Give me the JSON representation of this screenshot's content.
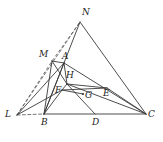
{
  "figure": {
    "kind": "geometry-diagram",
    "width": 163,
    "height": 142,
    "background": "#ffffff",
    "stroke_color": "#3a3a3a",
    "dash_color": "#555555",
    "label_color": "#1b1b1b"
  },
  "points": [
    {
      "id": "N",
      "label": "N",
      "x": 80,
      "y": 22,
      "label_x": 82,
      "label_y": 8,
      "marked": false
    },
    {
      "id": "M",
      "label": "M",
      "x": 52,
      "y": 61,
      "label_x": 39,
      "label_y": 50,
      "marked": false
    },
    {
      "id": "A",
      "label": "A",
      "x": 64,
      "y": 63,
      "label_x": 62,
      "label_y": 52,
      "marked": false
    },
    {
      "id": "H",
      "label": "H",
      "x": 67,
      "y": 84,
      "label_x": 66,
      "label_y": 71,
      "marked": false
    },
    {
      "id": "F",
      "label": "F",
      "x": 62,
      "y": 90,
      "label_x": 55,
      "label_y": 86,
      "marked": false
    },
    {
      "id": "G",
      "label": "G",
      "x": 83,
      "y": 94,
      "label_x": 85,
      "label_y": 91,
      "marked": true
    },
    {
      "id": "E",
      "label": "E",
      "x": 107,
      "y": 88,
      "label_x": 103,
      "label_y": 89,
      "marked": false
    },
    {
      "id": "L",
      "label": "L",
      "x": 17,
      "y": 115,
      "label_x": 5,
      "label_y": 110,
      "marked": false
    },
    {
      "id": "B",
      "label": "B",
      "x": 44,
      "y": 114,
      "label_x": 41,
      "label_y": 118,
      "marked": false
    },
    {
      "id": "D",
      "label": "D",
      "x": 95,
      "y": 114,
      "label_x": 92,
      "label_y": 118,
      "marked": false
    },
    {
      "id": "C",
      "label": "C",
      "x": 146,
      "y": 114,
      "label_x": 148,
      "label_y": 110,
      "marked": false
    }
  ],
  "solid_segments": [
    {
      "name": "segment-B-C",
      "from": "B",
      "to": "C"
    },
    {
      "name": "segment-N-C",
      "from": "N",
      "to": "C"
    },
    {
      "name": "segment-N-B",
      "from": "N",
      "to": "B"
    },
    {
      "name": "segment-M-B",
      "from": "M",
      "to": "B"
    },
    {
      "name": "segment-M-A",
      "from": "M",
      "to": "A"
    },
    {
      "name": "segment-M-H",
      "from": "M",
      "to": "H"
    },
    {
      "name": "segment-A-B",
      "from": "A",
      "to": "B"
    },
    {
      "name": "segment-A-H",
      "from": "A",
      "to": "H"
    },
    {
      "name": "segment-A-C",
      "from": "A",
      "to": "C"
    },
    {
      "name": "segment-L-A",
      "from": "L",
      "to": "A"
    },
    {
      "name": "segment-L-F",
      "from": "L",
      "to": "F"
    },
    {
      "name": "segment-H-F",
      "from": "H",
      "to": "F"
    },
    {
      "name": "segment-H-E",
      "from": "H",
      "to": "E"
    },
    {
      "name": "segment-H-C",
      "from": "H",
      "to": "C"
    },
    {
      "name": "segment-H-D",
      "from": "H",
      "to": "D"
    },
    {
      "name": "segment-F-G",
      "from": "F",
      "to": "G"
    },
    {
      "name": "segment-F-E",
      "from": "F",
      "to": "E"
    },
    {
      "name": "segment-E-C",
      "from": "E",
      "to": "C"
    },
    {
      "name": "segment-B-F",
      "from": "B",
      "to": "F"
    }
  ],
  "dashed_segments": [
    {
      "name": "dashed-L-B",
      "from": "L",
      "to": "B"
    },
    {
      "name": "dashed-L-N",
      "from": "L",
      "to": "N"
    },
    {
      "name": "dashed-L-M-N",
      "from": "L",
      "to": "N",
      "via": "M"
    }
  ]
}
